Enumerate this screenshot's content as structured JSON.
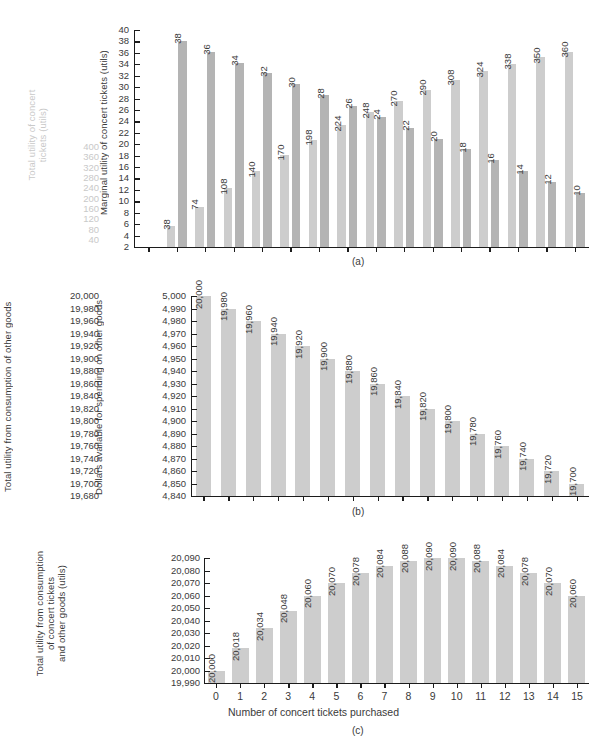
{
  "figure": {
    "xaxis_title": "Number of concert tickets purchased",
    "tickets": [
      0,
      1,
      2,
      3,
      4,
      5,
      6,
      7,
      8,
      9,
      10,
      11,
      12,
      13,
      14,
      15
    ]
  },
  "panel_a": {
    "caption": "(a)",
    "left_axis_label": "Total utility of concert tickets (utils)",
    "right_axis_label": "Marginal utility of concert tickets (utils)",
    "left_ticks": [
      400,
      360,
      320,
      280,
      240,
      200,
      160,
      120,
      80,
      40
    ],
    "right_ticks": [
      40,
      38,
      36,
      34,
      32,
      30,
      28,
      26,
      24,
      22,
      20,
      18,
      16,
      14,
      12,
      10,
      8,
      6,
      4,
      2
    ],
    "total_labels": [
      "38",
      "74",
      "108",
      "140",
      "170",
      "198",
      "224",
      "248",
      "270",
      "290",
      "308",
      "324",
      "338",
      "350",
      "360"
    ],
    "marginal_labels": [
      "38",
      "36",
      "34",
      "32",
      "30",
      "28",
      "26",
      "24",
      "22",
      "20",
      "18",
      "16",
      "14",
      "12",
      "10"
    ]
  },
  "panel_b": {
    "caption": "(b)",
    "left_axis_label": "Total utility from consumption of other goods",
    "right_axis_label": "Dollars available for spending on other goods",
    "left_ticks": [
      "20,000",
      "19,980",
      "19,960",
      "19,940",
      "19,920",
      "19,900",
      "19,880",
      "19,860",
      "19,840",
      "19,820",
      "19,800",
      "19,780",
      "19,760",
      "19,740",
      "19,720",
      "19,700",
      "19,680"
    ],
    "right_ticks": [
      "5,000",
      "4,990",
      "4,980",
      "4,970",
      "4,960",
      "4,950",
      "4,940",
      "4,930",
      "4,920",
      "4,910",
      "4,900",
      "4,890",
      "4,880",
      "4,870",
      "4,860",
      "4,850",
      "4,840"
    ],
    "bar_labels": [
      "20,000",
      "19,980",
      "19,960",
      "19,940",
      "19,920",
      "19,900",
      "19,880",
      "19,860",
      "19,840",
      "19,820",
      "19,800",
      "19,780",
      "19,760",
      "19,740",
      "19,720",
      "19,700"
    ]
  },
  "panel_c": {
    "caption": "(c)",
    "left_axis_label": "Total utility from consumption of concert tickets and other goods (utils)",
    "left_ticks": [
      "20,090",
      "20,080",
      "20,070",
      "20,060",
      "20,050",
      "20,040",
      "20,030",
      "20,020",
      "20,010",
      "20,000",
      "19,990"
    ],
    "bar_labels": [
      "20,000",
      "20,018",
      "20,034",
      "20,048",
      "20,060",
      "20,070",
      "20,078",
      "20,084",
      "20,088",
      "20,090",
      "20,090",
      "20,088",
      "20,084",
      "20,078",
      "20,070",
      "20,060"
    ]
  },
  "chart_data": [
    {
      "type": "bar",
      "panel": "(a)",
      "title": "",
      "xlabel": "Number of concert tickets purchased",
      "ylabel": "Total utility of concert tickets (utils)",
      "ylabel_right": "Marginal utility of concert tickets (utils)",
      "categories": [
        1,
        2,
        3,
        4,
        5,
        6,
        7,
        8,
        9,
        10,
        11,
        12,
        13,
        14,
        15
      ],
      "series": [
        {
          "name": "Total utility of concert tickets (utils)",
          "axis": "left",
          "color": "#cdcdcd",
          "values": [
            38,
            74,
            108,
            140,
            170,
            198,
            224,
            248,
            270,
            290,
            308,
            324,
            338,
            350,
            360
          ]
        },
        {
          "name": "Marginal utility of concert tickets (utils)",
          "axis": "right",
          "color": "#b4b4b4",
          "values": [
            38,
            36,
            34,
            32,
            30,
            28,
            26,
            24,
            22,
            20,
            18,
            16,
            14,
            12,
            10
          ]
        }
      ],
      "ylim": [
        0,
        400
      ],
      "ylim_right": [
        0,
        40
      ],
      "grid": false,
      "legend": "none"
    },
    {
      "type": "bar",
      "panel": "(b)",
      "title": "",
      "xlabel": "Number of concert tickets purchased",
      "ylabel": "Total utility from consumption of other goods",
      "ylabel_right": "Dollars available for spending on other goods",
      "categories": [
        0,
        1,
        2,
        3,
        4,
        5,
        6,
        7,
        8,
        9,
        10,
        11,
        12,
        13,
        14,
        15
      ],
      "values": [
        20000,
        19980,
        19960,
        19940,
        19920,
        19900,
        19880,
        19860,
        19840,
        19820,
        19800,
        19780,
        19760,
        19740,
        19720,
        19700
      ],
      "values_right": [
        5000,
        4990,
        4980,
        4970,
        4960,
        4950,
        4940,
        4930,
        4920,
        4910,
        4900,
        4890,
        4880,
        4870,
        4860,
        4850
      ],
      "ylim": [
        19680,
        20000
      ],
      "ylim_right": [
        4840,
        5000
      ],
      "grid": false,
      "legend": "none"
    },
    {
      "type": "bar",
      "panel": "(c)",
      "title": "",
      "xlabel": "Number of concert tickets purchased",
      "ylabel": "Total utility from consumption of concert tickets and other goods (utils)",
      "categories": [
        0,
        1,
        2,
        3,
        4,
        5,
        6,
        7,
        8,
        9,
        10,
        11,
        12,
        13,
        14,
        15
      ],
      "values": [
        20000,
        20018,
        20034,
        20048,
        20060,
        20070,
        20078,
        20084,
        20088,
        20090,
        20090,
        20088,
        20084,
        20078,
        20070,
        20060
      ],
      "ylim": [
        19990,
        20090
      ],
      "grid": false,
      "legend": "none"
    }
  ]
}
